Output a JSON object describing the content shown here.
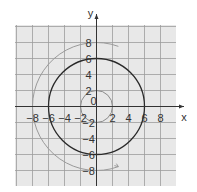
{
  "chart_data": {
    "type": "line",
    "title": "",
    "xlabel": "x",
    "ylabel": "y",
    "xlim": [
      -10,
      10
    ],
    "ylim": [
      -10,
      10
    ],
    "grid": true,
    "grid_step": 2,
    "x_ticks": [
      -8,
      -6,
      -4,
      -2,
      2,
      4,
      6,
      8
    ],
    "y_ticks": [
      8,
      6,
      4,
      2,
      -2,
      -4,
      -6,
      -8
    ],
    "origin_label": "0",
    "series": [
      {
        "name": "inner-spiral-arc",
        "shape": "circle",
        "radius": 2,
        "center": [
          0,
          0
        ],
        "color": "#8a8a8a"
      },
      {
        "name": "middle-circle",
        "shape": "circle",
        "radius": 6,
        "center": [
          0,
          0
        ],
        "color": "#2a2a2a"
      },
      {
        "name": "outer-spiral-arc",
        "shape": "arc",
        "radius": 8,
        "center": [
          0,
          0
        ],
        "color": "#9a9a9a",
        "arrow_end": true
      }
    ]
  },
  "colors": {
    "grid_bg": "#e8e8e8",
    "grid_line": "#9c9c9c",
    "axis": "#333333"
  }
}
